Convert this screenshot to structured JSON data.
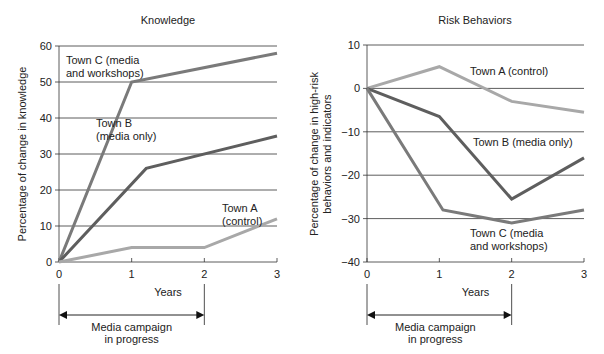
{
  "chart_data": [
    {
      "type": "line",
      "title": "Knowledge",
      "xlabel": "Years",
      "ylabel": "Percentage of change in knowledge",
      "x_ticks": [
        "0",
        "1",
        "2",
        "3"
      ],
      "y_ticks": [
        "0",
        "10",
        "20",
        "30",
        "40",
        "50",
        "60"
      ],
      "xlim": [
        0,
        3
      ],
      "ylim": [
        0,
        60
      ],
      "grid": "horizontal",
      "series": [
        {
          "name": "Town C (media and workshops)",
          "label_lines": [
            "Town C (media",
            "and workshops)"
          ],
          "color": "#7a7a7a",
          "points": [
            [
              0,
              0
            ],
            [
              1,
              50
            ],
            [
              3,
              58
            ]
          ]
        },
        {
          "name": "Town B (media only)",
          "label_lines": [
            "Town B",
            "(media only)"
          ],
          "color": "#5e5e5e",
          "points": [
            [
              0,
              0
            ],
            [
              1.2,
              26
            ],
            [
              3,
              35
            ]
          ]
        },
        {
          "name": "Town A (control)",
          "label_lines": [
            "Town A",
            "(control)"
          ],
          "color": "#a8a8a8",
          "points": [
            [
              0,
              0
            ],
            [
              1,
              4
            ],
            [
              2,
              4
            ],
            [
              3,
              12
            ]
          ]
        }
      ],
      "annotation": {
        "text_lines": [
          "Media campaign",
          "in progress"
        ],
        "from_x": 0,
        "to_x": 2
      }
    },
    {
      "type": "line",
      "title": "Risk Behaviors",
      "xlabel": "Years",
      "ylabel": "Percentage of change in high-risk behaviors and indicators",
      "ylabel_lines": [
        "Percentage of change in high-risk",
        "behaviors and indicators"
      ],
      "x_ticks": [
        "0",
        "1",
        "2",
        "3"
      ],
      "y_ticks": [
        "10",
        "0",
        "−10",
        "−20",
        "−30",
        "−40"
      ],
      "xlim": [
        0,
        3
      ],
      "ylim": [
        -40,
        10
      ],
      "grid": "horizontal",
      "series": [
        {
          "name": "Town A (control)",
          "label_lines": [
            "Town A (control)"
          ],
          "color": "#a8a8a8",
          "points": [
            [
              0,
              0
            ],
            [
              1,
              5
            ],
            [
              2,
              -3
            ],
            [
              3,
              -5.5
            ]
          ]
        },
        {
          "name": "Town B (media only)",
          "label_lines": [
            "Town B (media only)"
          ],
          "color": "#5e5e5e",
          "points": [
            [
              0,
              0
            ],
            [
              1,
              -6.5
            ],
            [
              2,
              -25.5
            ],
            [
              3,
              -16
            ]
          ]
        },
        {
          "name": "Town C (media and workshops)",
          "label_lines": [
            "Town C (media",
            "and workshops)"
          ],
          "color": "#7a7a7a",
          "points": [
            [
              0,
              0
            ],
            [
              1.05,
              -28
            ],
            [
              2,
              -31
            ],
            [
              3,
              -28
            ]
          ]
        }
      ],
      "annotation": {
        "text_lines": [
          "Media campaign",
          "in progress"
        ],
        "from_x": 0,
        "to_x": 2
      }
    }
  ]
}
